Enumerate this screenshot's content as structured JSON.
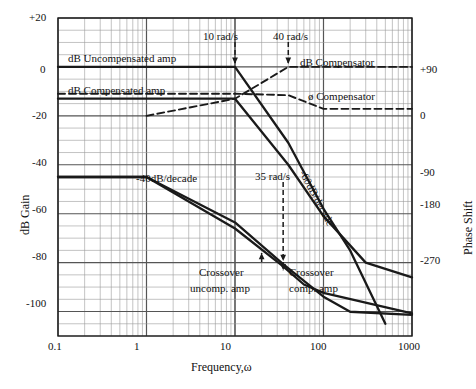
{
  "figure": {
    "kind": "bode-plot",
    "width": 469,
    "height": 389,
    "background": "#ffffff",
    "ink": "#1a1a1a",
    "grid_major_color": "#555555",
    "grid_minor_color": "#9a9a9a"
  },
  "axes": {
    "x_title": "Frequency,ω",
    "y_left_title": "dB Gain",
    "y_right_title": "Phase Shift",
    "x_ticks": [
      "0.1",
      "1",
      "10",
      "100",
      "1000"
    ],
    "y_left_ticks": [
      "+20",
      "0",
      "-20",
      "-40",
      "-60",
      "-80",
      "-100"
    ],
    "y_right_ticks": [
      "+90",
      "0",
      "-90",
      "-180",
      "-270"
    ]
  },
  "annotations": {
    "db_uncompensated": "dB Uncompensated amp",
    "db_compensated": "dB Compensated amp",
    "db_compensator": "dB Compensator",
    "phi_compensator": "ø Compensator",
    "slope_40": "-40dB/decade",
    "slope_60": "-60dB/decade",
    "w10": "10 rad/s",
    "w40": "40 rad/s",
    "w35": "35 rad/s",
    "crossover_uncomp_line1": "Crossover",
    "crossover_uncomp_line2": "uncomp. amp",
    "crossover_comp_line1": "Crossover",
    "crossover_comp_line2": "comp. amp"
  },
  "chart_data": {
    "type": "line",
    "title": "",
    "xlabel": "Frequency,ω",
    "ylabel": "dB Gain",
    "y2label": "Phase Shift",
    "xscale": "log",
    "xlim": [
      0.1,
      1000
    ],
    "ylim": [
      -110,
      20
    ],
    "y2lim": [
      -300,
      120
    ],
    "grid": true,
    "legend": "inline-annotations",
    "series": [
      {
        "name": "dB Uncompensated amp",
        "axis": "left",
        "style": "solid",
        "units": "dB",
        "points": [
          [
            0.1,
            0
          ],
          [
            1,
            0
          ],
          [
            10,
            0
          ],
          [
            40,
            -31
          ],
          [
            100,
            -58
          ],
          [
            200,
            -75
          ],
          [
            500,
            -105
          ]
        ],
        "breakpoints": [
          {
            "w": 10,
            "note": "10 rad/s"
          }
        ],
        "slope_after_break": "-60dB/decade"
      },
      {
        "name": "dB Compensated amp",
        "axis": "left",
        "style": "solid",
        "units": "dB",
        "points": [
          [
            0.1,
            -13
          ],
          [
            1,
            -13
          ],
          [
            10,
            -13
          ],
          [
            40,
            -40
          ],
          [
            100,
            -61
          ],
          [
            300,
            -80
          ],
          [
            1000,
            -86
          ]
        ],
        "breakpoints": [
          {
            "w": 10,
            "note": "10 rad/s"
          }
        ]
      },
      {
        "name": "Phase uncompensated",
        "axis": "right",
        "style": "solid",
        "units": "deg",
        "points": [
          [
            0.1,
            -90
          ],
          [
            1,
            -90
          ],
          [
            10,
            -150
          ],
          [
            35,
            -205
          ],
          [
            100,
            -248
          ],
          [
            200,
            -268
          ],
          [
            1000,
            -272
          ]
        ],
        "slope_label": "-40dB/decade"
      },
      {
        "name": "Phase compensated",
        "axis": "right",
        "style": "solid",
        "units": "deg",
        "points": [
          [
            0.1,
            -90
          ],
          [
            1,
            -90
          ],
          [
            10,
            -158
          ],
          [
            35,
            -208
          ],
          [
            60,
            -232
          ],
          [
            100,
            -243
          ],
          [
            1000,
            -270
          ]
        ]
      },
      {
        "name": "dB Compensator",
        "axis": "left",
        "style": "dashed",
        "units": "dB",
        "points": [
          [
            1,
            -20
          ],
          [
            10,
            -13
          ],
          [
            40,
            0
          ],
          [
            100,
            0
          ],
          [
            1000,
            0
          ]
        ],
        "breakpoints": [
          {
            "w": 40,
            "note": "40 rad/s"
          }
        ]
      },
      {
        "name": "ø Compensator",
        "axis": "right",
        "style": "dashed",
        "units": "deg",
        "points": [
          [
            0.1,
            20
          ],
          [
            1,
            20
          ],
          [
            10,
            20
          ],
          [
            40,
            18
          ],
          [
            100,
            0
          ],
          [
            1000,
            0
          ]
        ]
      },
      {
        "name": "35 rad/s marker",
        "axis": "right",
        "style": "dashed-arrow",
        "units": "deg",
        "points": [
          [
            35,
            -205
          ]
        ]
      }
    ],
    "crossovers": [
      {
        "label": "Crossover uncomp. amp",
        "w": 20
      },
      {
        "label": "Crossover comp. amp",
        "w": 35
      }
    ]
  }
}
